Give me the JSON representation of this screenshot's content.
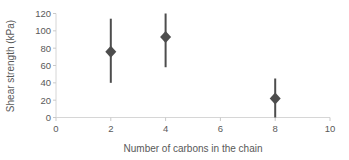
{
  "chart_data": {
    "type": "scatter",
    "title": "",
    "xlabel": "Number of carbons in the chain",
    "ylabel": "Shear strength (kPa)",
    "xlim": [
      0,
      10
    ],
    "ylim": [
      0,
      120
    ],
    "x_ticks": [
      0,
      2,
      4,
      6,
      8,
      10
    ],
    "y_ticks": [
      0,
      20,
      40,
      60,
      80,
      100,
      120
    ],
    "grid": false,
    "legend": false,
    "marker": "diamond",
    "colors": {
      "marker": "#4d4d4d",
      "error_bar": "#4d4d4d",
      "axis_line": "#d6d6d6",
      "tick_mark": "#c9c9c9",
      "label_text": "#595959",
      "background": "#ffffff"
    },
    "points": [
      {
        "x": 2,
        "y": 76,
        "err_low": 40,
        "err_high": 114
      },
      {
        "x": 4,
        "y": 93,
        "err_low": 58,
        "err_high": 120
      },
      {
        "x": 8,
        "y": 22,
        "err_low": 0,
        "err_high": 45
      }
    ]
  }
}
